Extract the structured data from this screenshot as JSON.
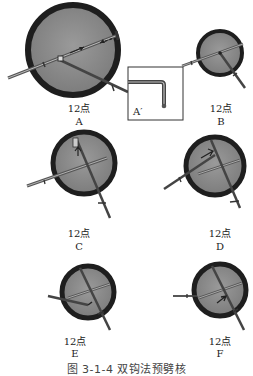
{
  "figure": {
    "caption": "图 3-1-4   双钩法预劈核",
    "panels": [
      {
        "id": "A",
        "clock": "12点",
        "letter": "A"
      },
      {
        "id": "B",
        "clock": "12点",
        "letter": "B"
      },
      {
        "id": "C",
        "clock": "12点",
        "letter": "C"
      },
      {
        "id": "D",
        "clock": "12点",
        "letter": "D"
      },
      {
        "id": "E",
        "clock": "12点",
        "letter": "E"
      },
      {
        "id": "F",
        "clock": "12点",
        "letter": "F"
      }
    ],
    "inset": {
      "label": "A′"
    },
    "colors": {
      "lens_fill": "#8a8a8a",
      "rim": "#1e1e1e",
      "instrument": "#4a4a4a"
    }
  }
}
